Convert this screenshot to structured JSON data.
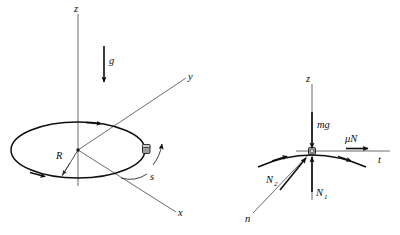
{
  "figure": {
    "background_color": "#ffffff",
    "line_color": "#101010",
    "axis_color": "#5a5a5a",
    "bead_color": "#9e9e9e"
  },
  "left_panel": {
    "name": "hoop-geometry-view",
    "description": "Three-dimensional perspective view of a circular hoop of radius R lying in a tilted plane, with vertical z axis through the centre, gravity g pointing down, body-frame x and y axes, and a bead on the hoop with arc-length coordinate s.",
    "axes": [
      {
        "id": "z",
        "label": "z",
        "orientation": "vertical-up"
      },
      {
        "id": "y",
        "label": "y",
        "orientation": "up-right"
      },
      {
        "id": "x",
        "label": "x",
        "orientation": "down-right"
      }
    ],
    "labels": {
      "z_axis": "z",
      "y_axis": "y",
      "x_axis": "x",
      "gravity": "g",
      "radius": "R",
      "arc_length": "s"
    },
    "geometry": {
      "hoop_center_x": 78,
      "hoop_center_y": 150,
      "hoop_radius_x": 67,
      "hoop_radius_y": 28,
      "bead_x": 146,
      "bead_y": 150,
      "radius_value_label": "R"
    }
  },
  "right_panel": {
    "name": "free-body-diagram",
    "description": "Free-body diagram of the bead at a point on the hoop, showing the local vertical z axis, tangential t axis, inward normal n axis, and the four force vectors acting on the bead.",
    "axes": [
      {
        "id": "z",
        "label": "z",
        "orientation": "vertical-up"
      },
      {
        "id": "t",
        "label": "t",
        "orientation": "horizontal-right"
      },
      {
        "id": "n",
        "label": "n",
        "orientation": "down-left"
      }
    ],
    "labels": {
      "z_axis": "z",
      "t_axis": "t",
      "n_axis": "n"
    },
    "forces": [
      {
        "id": "mg",
        "label": "mg",
        "direction": "down",
        "description": "weight of the bead"
      },
      {
        "id": "muN",
        "label": "μN",
        "direction": "right-along-t",
        "description": "friction force along the tangential direction"
      },
      {
        "id": "N1",
        "label": "N",
        "subscript": "1",
        "direction": "up",
        "description": "normal reaction component along the vertical"
      },
      {
        "id": "N2",
        "label": "N",
        "subscript": "2",
        "direction": "up-right-along-n",
        "description": "normal reaction component along the inward normal"
      }
    ]
  }
}
